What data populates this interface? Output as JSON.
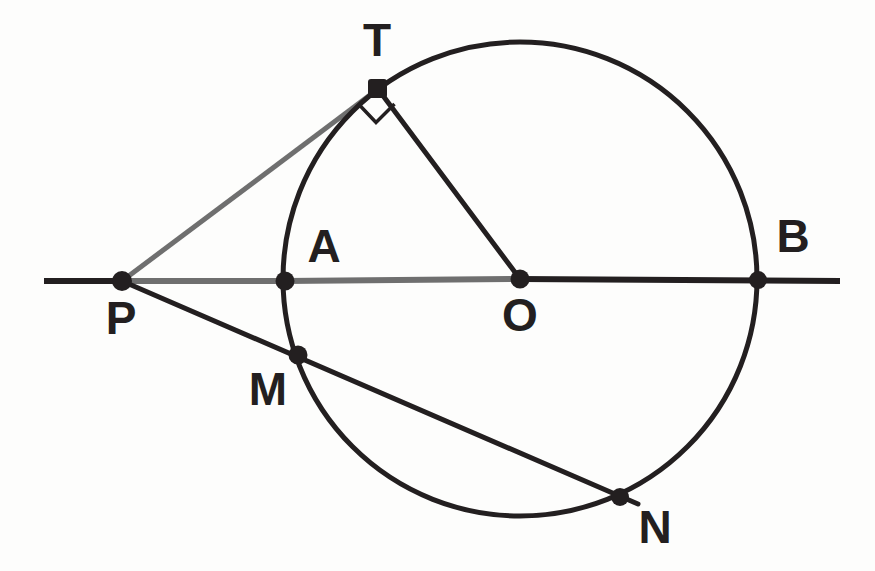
{
  "figure": {
    "background_color": "#fdfdfc",
    "stroke_dark": "#231f20",
    "stroke_gray": "#6f6f6f",
    "canvas": {
      "width": 875,
      "height": 571
    }
  },
  "circle": {
    "name": "main-circle",
    "center_label": "O",
    "cx": 520,
    "cy": 279,
    "r": 237,
    "stroke": "#231f20",
    "stroke_width": 5
  },
  "points": [
    {
      "id": "T",
      "label": "T",
      "x": 378,
      "y": 89,
      "label_x": 377,
      "label_y": 42,
      "dot_r": 9,
      "color": "#231f20"
    },
    {
      "id": "A",
      "label": "A",
      "x": 285,
      "y": 281,
      "label_x": 324,
      "label_y": 248,
      "dot_r": 9,
      "color": "#231f20"
    },
    {
      "id": "B",
      "label": "B",
      "x": 758,
      "y": 280,
      "label_x": 793,
      "label_y": 238,
      "dot_r": 8.5,
      "color": "#231f20"
    },
    {
      "id": "P",
      "label": "P",
      "x": 122,
      "y": 281,
      "label_x": 121,
      "label_y": 320,
      "dot_r": 9.5,
      "color": "#231f20"
    },
    {
      "id": "O",
      "label": "O",
      "x": 520,
      "y": 279,
      "label_x": 520,
      "label_y": 317,
      "dot_r": 9,
      "color": "#231f20"
    },
    {
      "id": "M",
      "label": "M",
      "x": 298,
      "y": 355,
      "label_x": 268,
      "label_y": 391,
      "dot_r": 9,
      "color": "#231f20"
    },
    {
      "id": "N",
      "label": "N",
      "x": 620,
      "y": 497,
      "label_x": 655,
      "label_y": 529,
      "dot_r": 8.5,
      "color": "#231f20"
    }
  ],
  "segments": [
    {
      "id": "line-PA-gray",
      "from": "P",
      "to": "A",
      "x1": 122,
      "y1": 281,
      "x2": 285,
      "y2": 281,
      "stroke": "#6f6f6f",
      "stroke_width": 6
    },
    {
      "id": "line-AO-gray",
      "from": "A",
      "to": "O",
      "x1": 285,
      "y1": 281,
      "x2": 520,
      "y2": 279,
      "stroke": "#6f6f6f",
      "stroke_width": 6
    },
    {
      "id": "line-left-ray",
      "from": "edge",
      "to": "P",
      "x1": 44,
      "y1": 281,
      "x2": 122,
      "y2": 281,
      "stroke": "#231f20",
      "stroke_width": 6
    },
    {
      "id": "line-OB-ray",
      "from": "O",
      "to": "edge",
      "x1": 520,
      "y1": 279,
      "x2": 840,
      "y2": 281,
      "stroke": "#231f20",
      "stroke_width": 6
    },
    {
      "id": "tangent-PT",
      "from": "P",
      "to": "T",
      "x1": 122,
      "y1": 281,
      "x2": 378,
      "y2": 89,
      "stroke": "#6f6f6f",
      "stroke_width": 5
    },
    {
      "id": "radius-TO",
      "from": "T",
      "to": "O",
      "x1": 378,
      "y1": 89,
      "x2": 520,
      "y2": 279,
      "stroke": "#231f20",
      "stroke_width": 5
    },
    {
      "id": "secant-PN",
      "from": "P",
      "to": "N",
      "x1": 122,
      "y1": 281,
      "x2": 636,
      "y2": 503,
      "stroke": "#231f20",
      "stroke_width": 5
    }
  ],
  "right_angle_marker": {
    "id": "right-angle-at-T",
    "at_point": "T",
    "symbol": "square",
    "path": "M 358.5 104 L 376 122.5 L 394.5 104",
    "stroke": "#231f20",
    "stroke_width": 3.5
  },
  "labels_summary": {
    "all": [
      "T",
      "A",
      "B",
      "P",
      "O",
      "M",
      "N"
    ],
    "font_size_px": 46,
    "font_weight": "bold"
  },
  "chart_data": {
    "type": "diagram",
    "elements": {
      "circle_center": "O",
      "circle_radius_px": 237,
      "tangent_point": "T",
      "tangent_from": "P",
      "secant_points": [
        "M",
        "N"
      ],
      "diameter_endpoints": [
        "A",
        "B"
      ],
      "right_angle_at": "T",
      "collinear_sets": [
        [
          "P",
          "A",
          "O",
          "B"
        ],
        [
          "P",
          "M",
          "N"
        ]
      ]
    }
  }
}
